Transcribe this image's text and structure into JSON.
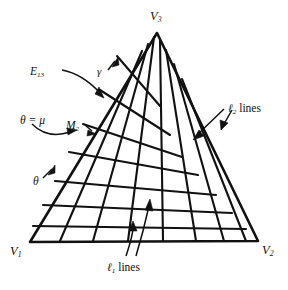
{
  "figure": {
    "type": "geometric-diagram",
    "background": "#ffffff",
    "ink": "#111111"
  },
  "vertices": [
    {
      "id": "V3",
      "base": "V",
      "sub": "3",
      "x": 157,
      "y": 33,
      "label_x": 150,
      "label_y": 10
    },
    {
      "id": "V1",
      "base": "V",
      "sub": "1",
      "x": 30,
      "y": 242,
      "label_x": 10,
      "label_y": 245
    },
    {
      "id": "V2",
      "base": "V",
      "sub": "2",
      "x": 258,
      "y": 241,
      "label_x": 262,
      "label_y": 244
    }
  ],
  "points": [
    {
      "id": "M2",
      "base": "M",
      "sub": "2",
      "x": 93,
      "y": 131,
      "label_x": 66,
      "label_y": 120
    }
  ],
  "annotations": [
    {
      "id": "E13",
      "base": "E",
      "sub": "13",
      "x": 30,
      "y": 66,
      "kind": "italic-sub"
    },
    {
      "id": "gamma",
      "text": "γ",
      "x": 97,
      "y": 66,
      "kind": "glyph"
    },
    {
      "id": "theta_mu",
      "text": "θ = μ",
      "x": 20,
      "y": 115,
      "kind": "glyph"
    },
    {
      "id": "theta",
      "text": "θ",
      "x": 33,
      "y": 176,
      "kind": "glyph"
    },
    {
      "id": "l2lines",
      "ell": "ℓ",
      "sub": "2",
      "word": "lines",
      "x": 228,
      "y": 103,
      "kind": "ell-lines"
    },
    {
      "id": "l1lines",
      "ell": "ℓ",
      "sub": "1",
      "word": "lines",
      "x": 107,
      "y": 262,
      "kind": "ell-lines"
    }
  ],
  "grid": {
    "family_l1": {
      "name": "ℓ1 lines",
      "count": 7,
      "orientation": "sub-horizontal"
    },
    "family_l2": {
      "name": "ℓ2 lines",
      "count": 7,
      "orientation": "steep"
    }
  }
}
